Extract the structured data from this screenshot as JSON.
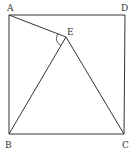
{
  "diagram": {
    "type": "geometry",
    "points": {
      "A": {
        "label": "A",
        "x": 9,
        "y": 15
      },
      "D": {
        "label": "D",
        "x": 125,
        "y": 15
      },
      "B": {
        "label": "B",
        "x": 9,
        "y": 134
      },
      "C": {
        "label": "C",
        "x": 124,
        "y": 134
      },
      "E": {
        "label": "E",
        "x": 66,
        "y": 37
      }
    },
    "segments": [
      "AD",
      "DC",
      "CB",
      "BA",
      "AE",
      "EB",
      "EC"
    ],
    "angle_marks": [
      {
        "vertex": "E",
        "between": [
          "A",
          "B"
        ]
      }
    ],
    "line_color": "#333333"
  }
}
